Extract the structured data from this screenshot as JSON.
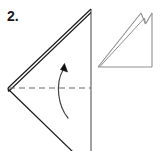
{
  "figure": {
    "kind": "paper-folding-instruction-diagram",
    "step_label": "2.",
    "canvas": {
      "width": 160,
      "height": 151,
      "background": "#ffffff"
    },
    "colors": {
      "ink_dark": "#1a1a1a",
      "ink_medium": "#555555",
      "ink_light": "#9a9a9a",
      "fold_line": "#6b6b6b",
      "arrow": "#444444",
      "background": "#ffffff"
    },
    "main_shape": {
      "name": "large-folded-triangle",
      "apex_top": [
        91,
        9
      ],
      "left_vertex": [
        8,
        88
      ],
      "vertical_edge_x": 91,
      "vertical_edge_from_y": 9,
      "vertical_edge_to_y": 151,
      "upper_edge": "from (8,88) to (91,9)",
      "lower_edge": "from (8,88) to (72,151)",
      "layer_offset_px": 3,
      "layer_count": 2
    },
    "fold_line": {
      "name": "horizontal-dashed-fold-crease",
      "from": [
        8,
        88
      ],
      "to": [
        91,
        88
      ],
      "style": "dashed",
      "dash_pattern": "6 4"
    },
    "fold_arrow": {
      "name": "curved-fold-direction-arrow",
      "direction": "upward",
      "tail": [
        68,
        118
      ],
      "head": [
        63,
        66
      ],
      "curve_control": [
        56,
        92
      ],
      "head_shape": "filled-triangle"
    },
    "result_shape": {
      "name": "small-result-triangle",
      "bottom_left": [
        98,
        67
      ],
      "bottom_right": [
        152,
        67
      ],
      "top_right": [
        152,
        13
      ],
      "notch_peak": [
        141,
        13
      ],
      "notch_valley": [
        145,
        23
      ],
      "layer_offset_px": 3,
      "layer_count": 2,
      "description": "right triangle with notched top-left of vertical edge"
    }
  }
}
